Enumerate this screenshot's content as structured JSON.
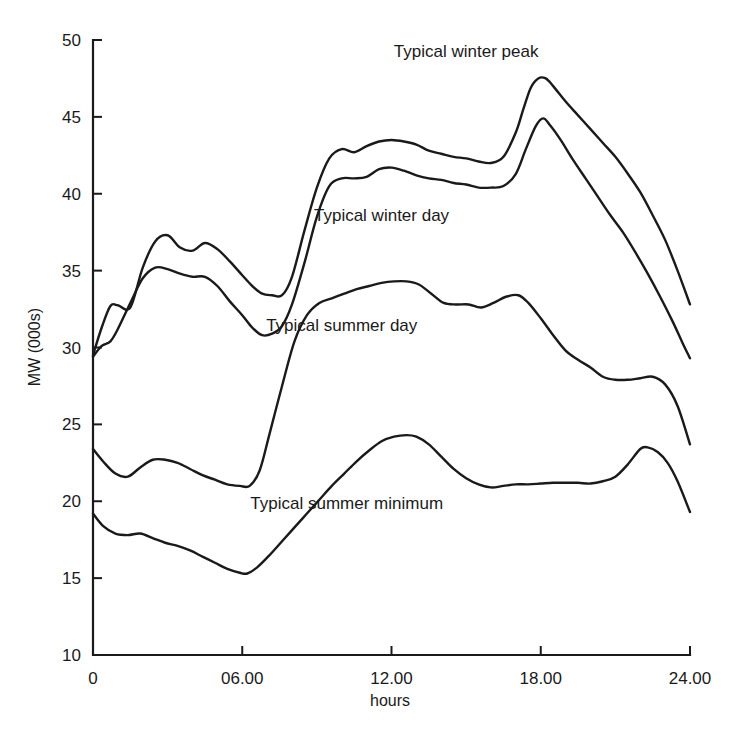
{
  "chart_data": {
    "type": "line",
    "title": "",
    "subtitle": "",
    "xlabel": "hours",
    "ylabel": "MW (000s)",
    "xlim": [
      0,
      24
    ],
    "ylim": [
      10,
      50
    ],
    "grid": false,
    "legend_position": "inline-annotations",
    "x_tick_values": [
      0,
      6,
      12,
      18,
      24
    ],
    "x_tick_labels": [
      "0",
      "06.00",
      "12.00",
      "18.00",
      "24.00"
    ],
    "y_tick_values": [
      10,
      15,
      20,
      25,
      30,
      35,
      40,
      45,
      50
    ],
    "y_tick_labels": [
      "10",
      "15",
      "20",
      "25",
      "30",
      "35",
      "40",
      "45",
      "50"
    ],
    "line_color": "#1a1a1a",
    "background_color": "#ffffff",
    "series": [
      {
        "name": "Typical winter peak",
        "label": "Typical winter peak",
        "label_x": 15.0,
        "label_y": 48.9,
        "x": [
          0.0,
          0.35,
          0.7,
          1.0,
          1.5,
          2.0,
          2.5,
          3.0,
          3.5,
          4.0,
          4.5,
          5.0,
          5.5,
          6.0,
          6.4,
          6.8,
          7.2,
          7.6,
          8.0,
          8.5,
          9.0,
          9.5,
          10.0,
          10.5,
          11.0,
          11.5,
          12.0,
          12.5,
          13.0,
          13.5,
          14.0,
          14.5,
          15.0,
          15.5,
          16.0,
          16.5,
          17.0,
          17.3,
          17.6,
          17.9,
          18.2,
          18.5,
          19.0,
          19.5,
          20.0,
          20.5,
          21.0,
          21.5,
          22.0,
          22.5,
          23.0,
          23.5,
          24.0
        ],
        "y": [
          29.5,
          31.3,
          32.7,
          32.75,
          32.6,
          35.2,
          36.9,
          37.3,
          36.5,
          36.3,
          36.8,
          36.4,
          35.6,
          34.7,
          34.0,
          33.5,
          33.4,
          33.4,
          34.6,
          37.6,
          40.4,
          42.3,
          42.9,
          42.7,
          43.1,
          43.4,
          43.5,
          43.4,
          43.2,
          42.8,
          42.6,
          42.4,
          42.3,
          42.1,
          42.0,
          42.4,
          44.0,
          45.5,
          46.9,
          47.5,
          47.5,
          47.0,
          46.0,
          45.1,
          44.2,
          43.3,
          42.4,
          41.3,
          40.1,
          38.6,
          37.0,
          35.0,
          32.8
        ]
      },
      {
        "name": "Typical winter day",
        "label": "Typical winter day",
        "label_x": 11.6,
        "label_y": 38.2,
        "x": [
          0.0,
          0.35,
          0.7,
          1.0,
          1.5,
          2.0,
          2.5,
          3.0,
          3.5,
          4.0,
          4.5,
          5.0,
          5.5,
          6.0,
          6.4,
          6.8,
          7.2,
          7.6,
          8.0,
          8.5,
          9.0,
          9.5,
          10.0,
          10.5,
          11.0,
          11.5,
          12.0,
          12.5,
          13.0,
          13.5,
          14.0,
          14.5,
          15.0,
          15.5,
          16.0,
          16.5,
          17.0,
          17.4,
          17.8,
          18.1,
          18.4,
          18.8,
          19.3,
          19.8,
          20.3,
          20.8,
          21.3,
          21.8,
          22.3,
          22.8,
          23.3,
          23.7,
          24.0
        ],
        "y": [
          29.4,
          30.1,
          30.4,
          31.2,
          32.9,
          34.5,
          35.2,
          35.1,
          34.8,
          34.6,
          34.6,
          34.0,
          33.0,
          32.1,
          31.3,
          30.8,
          30.9,
          31.4,
          32.8,
          35.5,
          38.5,
          40.5,
          41.0,
          41.0,
          41.1,
          41.6,
          41.7,
          41.5,
          41.2,
          41.0,
          40.9,
          40.7,
          40.6,
          40.4,
          40.4,
          40.5,
          41.3,
          42.9,
          44.4,
          44.9,
          44.4,
          43.5,
          42.2,
          41.0,
          39.8,
          38.6,
          37.5,
          36.2,
          34.8,
          33.3,
          31.7,
          30.3,
          29.3
        ]
      },
      {
        "name": "Typical summer day",
        "label": "Typical summer day",
        "label_x": 10.0,
        "label_y": 31.1,
        "x": [
          0.0,
          0.4,
          0.9,
          1.4,
          1.9,
          2.4,
          2.9,
          3.4,
          3.9,
          4.4,
          4.9,
          5.4,
          5.9,
          6.3,
          6.7,
          7.1,
          7.6,
          8.1,
          8.6,
          9.1,
          9.6,
          10.1,
          10.6,
          11.1,
          11.6,
          12.1,
          12.6,
          13.1,
          13.6,
          14.1,
          14.6,
          15.1,
          15.6,
          16.1,
          16.6,
          17.1,
          17.5,
          18.0,
          18.5,
          19.0,
          19.5,
          20.0,
          20.5,
          21.0,
          21.5,
          22.0,
          22.5,
          23.0,
          23.5,
          24.0
        ],
        "y": [
          23.4,
          22.6,
          21.8,
          21.6,
          22.2,
          22.7,
          22.7,
          22.5,
          22.1,
          21.7,
          21.4,
          21.1,
          21.0,
          21.0,
          22.0,
          24.4,
          27.5,
          30.4,
          32.1,
          32.9,
          33.2,
          33.5,
          33.8,
          34.0,
          34.2,
          34.3,
          34.3,
          34.1,
          33.5,
          32.9,
          32.8,
          32.8,
          32.6,
          32.9,
          33.3,
          33.4,
          32.9,
          31.9,
          30.8,
          29.8,
          29.2,
          28.7,
          28.1,
          27.9,
          27.9,
          28.0,
          28.1,
          27.6,
          26.2,
          23.7
        ]
      },
      {
        "name": "Typical summer minimum",
        "label": "Typical summer minimum",
        "label_x": 10.2,
        "label_y": 19.5,
        "x": [
          0.0,
          0.4,
          0.9,
          1.4,
          1.9,
          2.4,
          2.9,
          3.4,
          3.9,
          4.4,
          4.9,
          5.4,
          5.9,
          6.2,
          6.6,
          7.1,
          7.6,
          8.1,
          8.6,
          9.1,
          9.6,
          10.1,
          10.6,
          11.1,
          11.6,
          12.1,
          12.6,
          13.0,
          13.5,
          14.0,
          14.5,
          15.0,
          15.5,
          16.0,
          16.5,
          17.0,
          17.5,
          18.0,
          18.5,
          19.0,
          19.5,
          20.0,
          20.5,
          21.0,
          21.5,
          22.0,
          22.3,
          22.7,
          23.1,
          23.5,
          24.0
        ],
        "y": [
          19.2,
          18.4,
          17.9,
          17.8,
          17.9,
          17.6,
          17.3,
          17.1,
          16.8,
          16.4,
          16.0,
          15.6,
          15.35,
          15.3,
          15.7,
          16.5,
          17.4,
          18.3,
          19.2,
          20.1,
          21.0,
          21.8,
          22.6,
          23.3,
          23.9,
          24.2,
          24.3,
          24.2,
          23.7,
          22.9,
          22.1,
          21.5,
          21.1,
          20.9,
          21.0,
          21.1,
          21.1,
          21.15,
          21.2,
          21.2,
          21.2,
          21.15,
          21.3,
          21.6,
          22.4,
          23.4,
          23.5,
          23.2,
          22.5,
          21.3,
          19.3
        ]
      }
    ]
  },
  "figure": {
    "axis_label_x": "hours",
    "axis_label_y": "MW (000s)"
  }
}
